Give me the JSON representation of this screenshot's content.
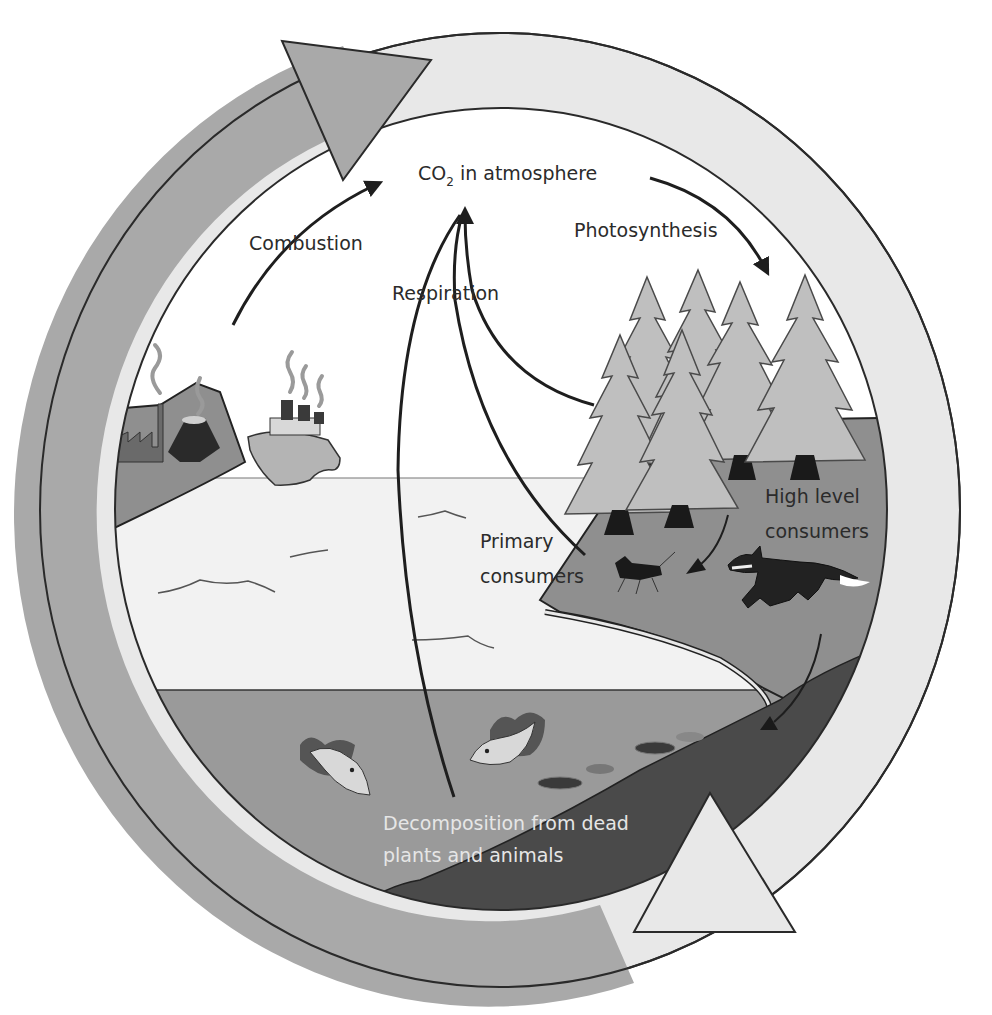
{
  "diagram": {
    "type": "cycle-diagram",
    "colors": {
      "background": "#ffffff",
      "outer_ring_left": "#a9a9a9",
      "outer_ring_right": "#e8e8e8",
      "sky": "#ffffff",
      "sea_surface": "#f2f2f2",
      "deep_water": "#9a9a9a",
      "seabed": "#4a4a4a",
      "land": "#8f8f8f",
      "trees": "#bfbfbf",
      "arrows": "#1e1e1e"
    },
    "labels": {
      "co2_prefix": "CO",
      "co2_subscript": "2",
      "co2_suffix": " in atmosphere",
      "combustion": "Combustion",
      "photosynthesis": "Photosynthesis",
      "respiration": "Respiration",
      "primary_consumers_line1": "Primary",
      "primary_consumers_line2": "consumers",
      "high_level_line1": "High level",
      "high_level_line2": "consumers",
      "decomposition_line1": "Decomposition from dead",
      "decomposition_line2": "plants and animals"
    },
    "nodes": [
      {
        "id": "co2",
        "label": "CO2 in atmosphere"
      },
      {
        "id": "fossil",
        "label": "Factories, volcano and ship (fuel combustion)"
      },
      {
        "id": "trees",
        "label": "Forest"
      },
      {
        "id": "primary",
        "label": "Primary consumers"
      },
      {
        "id": "high",
        "label": "High level consumers"
      },
      {
        "id": "decomp",
        "label": "Decomposition from dead plants and animals"
      }
    ],
    "edges": [
      {
        "from": "fossil",
        "to": "co2",
        "label": "Combustion"
      },
      {
        "from": "co2",
        "to": "trees",
        "label": "Photosynthesis"
      },
      {
        "from": "trees",
        "to": "co2",
        "label": "Respiration"
      },
      {
        "from": "primary",
        "to": "co2",
        "label": "Respiration"
      },
      {
        "from": "decomp",
        "to": "co2",
        "label": "Respiration"
      },
      {
        "from": "trees",
        "to": "primary",
        "label": ""
      },
      {
        "from": "high",
        "to": "decomp",
        "label": ""
      }
    ],
    "icons": [
      "factory-icon",
      "volcano-icon",
      "ship-icon",
      "pine-tree-icon",
      "insect-icon",
      "fox-icon",
      "fish-icon",
      "cycle-arrow-icon"
    ]
  }
}
